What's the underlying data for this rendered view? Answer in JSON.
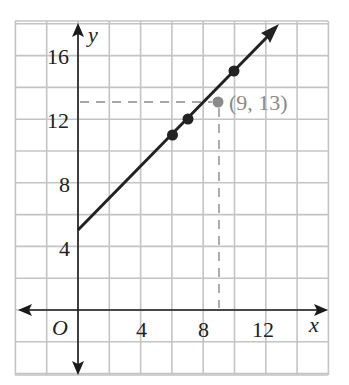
{
  "chart_data": {
    "type": "line",
    "title": "",
    "xlabel": "x",
    "ylabel": "y",
    "origin_label": "O",
    "xlim": [
      -4,
      16
    ],
    "ylim": [
      -4,
      18
    ],
    "grid": true,
    "grid_step": 2,
    "x_ticks": [
      4,
      8,
      12
    ],
    "x_tick_labels": [
      "4",
      "8",
      "12"
    ],
    "y_ticks": [
      4,
      8,
      12,
      16
    ],
    "y_tick_labels": [
      "4",
      "8",
      "12",
      "16"
    ],
    "series": [
      {
        "name": "line y = x + 5",
        "equation": "y = x + 5",
        "start": [
          0,
          5
        ],
        "direction": "extends up-right with arrow",
        "points": [
          [
            6,
            11
          ],
          [
            7,
            12
          ],
          [
            10,
            15
          ]
        ],
        "color": "#222222"
      }
    ],
    "annotations": [
      {
        "type": "point",
        "x": 9,
        "y": 13,
        "label": "(9, 13)",
        "color": "#8a8a8a",
        "dashed_guides": true
      }
    ]
  },
  "labels": {
    "x_axis": "x",
    "y_axis": "y",
    "origin": "O",
    "xt4": "4",
    "xt8": "8",
    "xt12": "12",
    "yt4": "4",
    "yt8": "8",
    "yt12": "12",
    "yt16": "16",
    "point_label": "(9, 13)"
  }
}
